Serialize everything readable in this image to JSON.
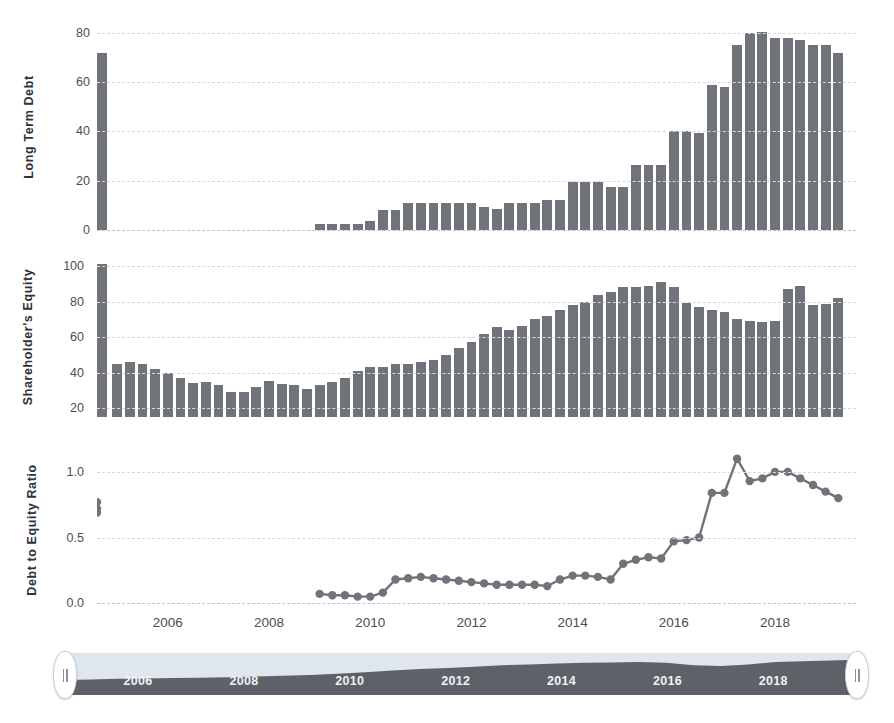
{
  "chart_data": [
    {
      "type": "bar",
      "title": "",
      "ylabel": "Long Term Debt",
      "xlabel": "",
      "ylim": [
        0,
        86
      ],
      "yticks": [
        0,
        20,
        40,
        60,
        80
      ],
      "ytick_labels": [
        "0",
        "20",
        "40",
        "60",
        "80"
      ],
      "grid": true,
      "color": "#70737a",
      "x": [
        2005.0,
        2005.25,
        2005.5,
        2005.75,
        2006.0,
        2006.25,
        2006.5,
        2006.75,
        2007.0,
        2007.25,
        2007.5,
        2007.75,
        2008.0,
        2008.25,
        2008.5,
        2008.75,
        2009.0,
        2009.25,
        2009.5,
        2009.75,
        2010.0,
        2010.25,
        2010.5,
        2010.75,
        2011.0,
        2011.25,
        2011.5,
        2011.75,
        2012.0,
        2012.25,
        2012.5,
        2012.75,
        2013.0,
        2013.25,
        2013.5,
        2013.75,
        2014.0,
        2014.25,
        2014.5,
        2014.75,
        2015.0,
        2015.25,
        2015.5,
        2015.75,
        2016.0,
        2016.25,
        2016.5,
        2016.75,
        2017.0,
        2017.25,
        2017.5,
        2017.75,
        2018.0,
        2018.25,
        2018.5,
        2018.75,
        2019.0,
        2019.25
      ],
      "values": [
        0,
        0,
        0,
        0,
        0,
        0,
        0,
        0,
        0,
        0,
        0,
        0,
        0,
        0,
        0,
        0,
        2.5,
        2.5,
        2.5,
        2.5,
        3.5,
        8,
        8,
        11,
        11,
        11,
        11,
        11,
        11,
        9.5,
        8.5,
        11,
        11,
        11,
        12,
        12,
        19.5,
        19.5,
        19.5,
        17.5,
        17.5,
        26.5,
        26.5,
        26.5,
        40,
        40,
        39.5,
        59,
        58,
        75,
        80,
        80.5,
        78,
        78,
        77,
        75,
        75,
        72,
        72
      ]
    },
    {
      "type": "bar",
      "title": "",
      "ylabel": "Shareholder's Equity",
      "xlabel": "",
      "ylim": [
        15,
        108
      ],
      "yticks": [
        20,
        40,
        60,
        80,
        100
      ],
      "ytick_labels": [
        "20",
        "40",
        "60",
        "80",
        "100"
      ],
      "grid": true,
      "color": "#70737a",
      "x": [
        2005.0,
        2005.25,
        2005.5,
        2005.75,
        2006.0,
        2006.25,
        2006.5,
        2006.75,
        2007.0,
        2007.25,
        2007.5,
        2007.75,
        2008.0,
        2008.25,
        2008.5,
        2008.75,
        2009.0,
        2009.25,
        2009.5,
        2009.75,
        2010.0,
        2010.25,
        2010.5,
        2010.75,
        2011.0,
        2011.25,
        2011.5,
        2011.75,
        2012.0,
        2012.25,
        2012.5,
        2012.75,
        2013.0,
        2013.25,
        2013.5,
        2013.75,
        2014.0,
        2014.25,
        2014.5,
        2014.75,
        2015.0,
        2015.25,
        2015.5,
        2015.75,
        2016.0,
        2016.25,
        2016.5,
        2016.75,
        2017.0,
        2017.25,
        2017.5,
        2017.75,
        2018.0,
        2018.25,
        2018.5,
        2018.75,
        2019.0,
        2019.25
      ],
      "values": [
        45,
        46,
        45,
        42,
        40,
        37,
        34,
        34.5,
        33,
        29,
        29,
        32,
        35.5,
        33.5,
        33,
        31,
        33,
        35,
        37,
        41,
        43,
        43,
        45,
        45,
        46,
        47,
        50,
        54,
        57.5,
        62,
        66,
        64,
        66.5,
        70.5,
        72,
        75.5,
        78,
        80,
        83.5,
        85.5,
        88,
        88.5,
        89,
        91,
        88.5,
        79.5,
        77,
        75.5,
        74,
        70.5,
        69,
        68.5,
        69,
        87,
        89,
        78,
        78.5,
        82,
        85,
        91.5,
        94.5,
        101
      ]
    },
    {
      "type": "line",
      "title": "",
      "ylabel": "Debt to Equity Ratio",
      "xlabel": "",
      "ylim": [
        -0.06,
        1.22
      ],
      "yticks": [
        0.0,
        0.5,
        1.0
      ],
      "ytick_labels": [
        "0.0",
        "0.5",
        "1.0"
      ],
      "grid": true,
      "color": "#70737a",
      "marker": "circle",
      "x": [
        2009.0,
        2009.25,
        2009.5,
        2009.75,
        2010.0,
        2010.25,
        2010.5,
        2010.75,
        2011.0,
        2011.25,
        2011.5,
        2011.75,
        2012.0,
        2012.25,
        2012.5,
        2012.75,
        2013.0,
        2013.25,
        2013.5,
        2013.75,
        2014.0,
        2014.25,
        2014.5,
        2014.75,
        2015.0,
        2015.25,
        2015.5,
        2015.75,
        2016.0,
        2016.25,
        2016.5,
        2016.75,
        2017.0,
        2017.25,
        2017.5,
        2017.75,
        2018.0,
        2018.25,
        2018.5,
        2018.75,
        2019.0,
        2019.25
      ],
      "values": [
        0.07,
        0.06,
        0.06,
        0.05,
        0.05,
        0.08,
        0.18,
        0.19,
        0.2,
        0.19,
        0.18,
        0.17,
        0.16,
        0.15,
        0.14,
        0.14,
        0.14,
        0.14,
        0.13,
        0.18,
        0.21,
        0.21,
        0.2,
        0.18,
        0.3,
        0.33,
        0.35,
        0.34,
        0.47,
        0.48,
        0.5,
        0.84,
        0.84,
        1.1,
        0.93,
        0.95,
        1.0,
        1.0,
        0.95,
        0.9,
        0.85,
        0.8,
        0.77,
        0.72,
        0.69
      ]
    }
  ],
  "xaxis": {
    "ticks": [
      2006,
      2008,
      2010,
      2012,
      2014,
      2016,
      2018
    ],
    "tick_labels": [
      "2006",
      "2008",
      "2010",
      "2012",
      "2014",
      "2016",
      "2018"
    ],
    "range": [
      2004.6,
      2019.6
    ]
  },
  "navigator": {
    "name": "range-selector",
    "tick_labels": [
      "2006",
      "2008",
      "2010",
      "2012",
      "2014",
      "2016",
      "2018"
    ],
    "ticks": [
      2006,
      2008,
      2010,
      2012,
      2014,
      2016,
      2018
    ],
    "range": [
      2004.6,
      2019.6
    ],
    "area_values": [
      32,
      33,
      35,
      36,
      37,
      38,
      39,
      41,
      43,
      45,
      48,
      52,
      56,
      60,
      63,
      66,
      70,
      72,
      74,
      76,
      77,
      78,
      76,
      70,
      68,
      72,
      78,
      80,
      82,
      84
    ],
    "left_handle_label": "left-handle",
    "right_handle_label": "right-handle",
    "track_color": "#dfe6ed",
    "series_color": "#5e6167"
  },
  "colors": {
    "bar": "#70737a",
    "line": "#70737a",
    "grid": "#d8dade",
    "zero_grid": "#b9c4cf",
    "tick_text": "#4a4d52",
    "axis_title": "#2f3237",
    "nav_track": "#dfe6ed",
    "nav_series": "#5e6167"
  }
}
